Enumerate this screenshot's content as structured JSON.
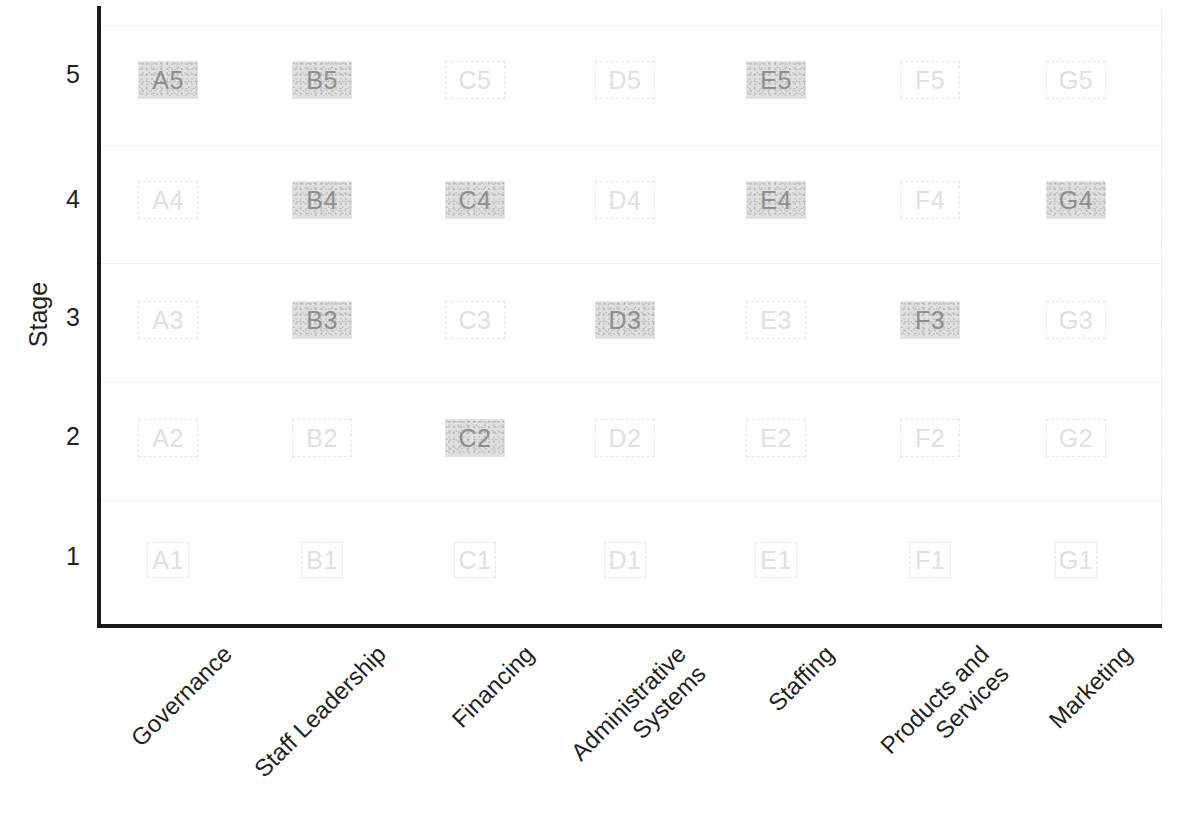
{
  "chart_data": {
    "type": "heatmap",
    "title": "",
    "xlabel": "",
    "ylabel": "Stage",
    "categories": [
      "Governance",
      "Staff Leadership",
      "Financing",
      "Administrative\nSystems",
      "Staffing",
      "Products and\nServices",
      "Marketing"
    ],
    "column_keys": [
      "A",
      "B",
      "C",
      "D",
      "E",
      "F",
      "G"
    ],
    "row_ticks": [
      "5",
      "4",
      "3",
      "2",
      "1"
    ],
    "ylim": [
      1,
      5
    ],
    "grid": true,
    "legend": "none",
    "cells": [
      {
        "label": "A5",
        "col": 0,
        "row": 5,
        "shaded": true
      },
      {
        "label": "B5",
        "col": 1,
        "row": 5,
        "shaded": true
      },
      {
        "label": "C5",
        "col": 2,
        "row": 5,
        "shaded": false
      },
      {
        "label": "D5",
        "col": 3,
        "row": 5,
        "shaded": false
      },
      {
        "label": "E5",
        "col": 4,
        "row": 5,
        "shaded": true
      },
      {
        "label": "F5",
        "col": 5,
        "row": 5,
        "shaded": false
      },
      {
        "label": "G5",
        "col": 6,
        "row": 5,
        "shaded": false
      },
      {
        "label": "A4",
        "col": 0,
        "row": 4,
        "shaded": false
      },
      {
        "label": "B4",
        "col": 1,
        "row": 4,
        "shaded": true
      },
      {
        "label": "C4",
        "col": 2,
        "row": 4,
        "shaded": true
      },
      {
        "label": "D4",
        "col": 3,
        "row": 4,
        "shaded": false
      },
      {
        "label": "E4",
        "col": 4,
        "row": 4,
        "shaded": true
      },
      {
        "label": "F4",
        "col": 5,
        "row": 4,
        "shaded": false
      },
      {
        "label": "G4",
        "col": 6,
        "row": 4,
        "shaded": true
      },
      {
        "label": "A3",
        "col": 0,
        "row": 3,
        "shaded": false
      },
      {
        "label": "B3",
        "col": 1,
        "row": 3,
        "shaded": true
      },
      {
        "label": "C3",
        "col": 2,
        "row": 3,
        "shaded": false
      },
      {
        "label": "D3",
        "col": 3,
        "row": 3,
        "shaded": true
      },
      {
        "label": "E3",
        "col": 4,
        "row": 3,
        "shaded": false
      },
      {
        "label": "F3",
        "col": 5,
        "row": 3,
        "shaded": true
      },
      {
        "label": "G3",
        "col": 6,
        "row": 3,
        "shaded": false
      },
      {
        "label": "A2",
        "col": 0,
        "row": 2,
        "shaded": false
      },
      {
        "label": "B2",
        "col": 1,
        "row": 2,
        "shaded": false
      },
      {
        "label": "C2",
        "col": 2,
        "row": 2,
        "shaded": true
      },
      {
        "label": "D2",
        "col": 3,
        "row": 2,
        "shaded": false
      },
      {
        "label": "E2",
        "col": 4,
        "row": 2,
        "shaded": false
      },
      {
        "label": "F2",
        "col": 5,
        "row": 2,
        "shaded": false
      },
      {
        "label": "G2",
        "col": 6,
        "row": 2,
        "shaded": false
      },
      {
        "label": "A1",
        "col": 0,
        "row": 1,
        "shaded": false
      },
      {
        "label": "B1",
        "col": 1,
        "row": 1,
        "shaded": false
      },
      {
        "label": "C1",
        "col": 2,
        "row": 1,
        "shaded": false
      },
      {
        "label": "D1",
        "col": 3,
        "row": 1,
        "shaded": false
      },
      {
        "label": "E1",
        "col": 4,
        "row": 1,
        "shaded": false
      },
      {
        "label": "F1",
        "col": 5,
        "row": 1,
        "shaded": false
      },
      {
        "label": "G1",
        "col": 6,
        "row": 1,
        "shaded": false
      }
    ]
  },
  "colors": {
    "axis": "#1a1a1a",
    "text": "#231f20",
    "shaded_fill": "#e0e0e0",
    "shaded_text": "#8d8d8d",
    "unshaded_outline": "#e6e6e6",
    "unshaded_text": "#e0e0e0",
    "gridline": "#e8e8e8"
  }
}
